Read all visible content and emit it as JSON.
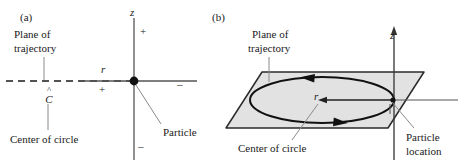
{
  "figure": {
    "panels": [
      {
        "tag": "(a)",
        "view": "edge-on cross-section of circular trajectory",
        "labels": {
          "plane_of_trajectory_line1": "Plane of",
          "plane_of_trajectory_line2": "trajectory",
          "center_of_circle": "Center of circle",
          "center_symbol": "C",
          "center_symbol_accent": "hat",
          "particle": "Particle",
          "axis_z": "z",
          "axis_r": "r",
          "z_positive": "+",
          "z_negative": "–",
          "r_positive": "+",
          "r_negative": "–"
        }
      },
      {
        "tag": "(b)",
        "view": "three-dimensional perspective of circular trajectory",
        "labels": {
          "plane_of_trajectory_line1": "Plane of",
          "plane_of_trajectory_line2": "trajectory",
          "center_of_circle": "Center of circle",
          "particle_location_line1": "Particle",
          "particle_location_line2": "location",
          "axis_z": "z",
          "axis_r": "r"
        }
      }
    ],
    "colors": {
      "ink": "#1a1a1a",
      "axis": "#555555",
      "leader": "#8a8a8a",
      "plane_fill": "#e2e2e2",
      "plane_edge": "#2b2b2b",
      "circle_stroke": "#111111",
      "background": "#ffffff"
    }
  }
}
